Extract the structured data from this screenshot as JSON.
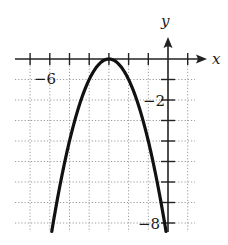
{
  "chart_data": {
    "type": "line",
    "title": "",
    "xlabel": "x",
    "ylabel": "y",
    "function": "y = -(x + 3)^2",
    "vertex": [
      -3,
      0
    ],
    "xlim": [
      -7.8,
      1.4
    ],
    "ylim": [
      -8.5,
      1.1
    ],
    "grid": true,
    "grid_style": "dotted",
    "x_ticks": [
      -7,
      -6,
      -5,
      -4,
      -3,
      -2,
      -1,
      0,
      1
    ],
    "y_ticks": [
      -8,
      -7,
      -6,
      -5,
      -4,
      -3,
      -2,
      -1
    ],
    "x_tick_labels": [
      {
        "value": -6,
        "text": "−6"
      }
    ],
    "y_tick_labels": [
      {
        "value": -2,
        "text": "−2"
      },
      {
        "value": -8,
        "text": "−8"
      }
    ],
    "series": [
      {
        "name": "parabola",
        "x": [
          -5.9,
          -5.5,
          -5,
          -4.5,
          -4,
          -3.5,
          -3,
          -2.5,
          -2,
          -1.5,
          -1,
          -0.5,
          -0.1
        ],
        "y": [
          -8.41,
          -6.25,
          -4,
          -2.25,
          -1,
          -0.25,
          0,
          -0.25,
          -1,
          -2.25,
          -4,
          -6.25,
          -8.41
        ]
      }
    ]
  },
  "labels": {
    "x_axis": "x",
    "y_axis": "y",
    "x_tick_neg6": "−6",
    "y_tick_neg2": "−2",
    "y_tick_neg8": "−8"
  }
}
